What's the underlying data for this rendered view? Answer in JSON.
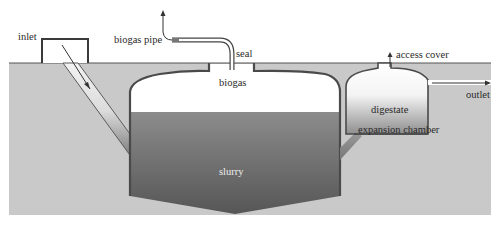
{
  "diagram": {
    "labels": {
      "inlet": "inlet",
      "biogas_pipe": "biogas pipe",
      "seal": "seal",
      "biogas": "biogas",
      "access_cover": "access cover",
      "outlet": "outlet",
      "digestate": "digestate",
      "expansion_chamber": "expansion chamber",
      "slurry": "slurry"
    },
    "components": [
      {
        "id": "inlet",
        "description": "inlet box with sloped inlet pipe and downward flow arrow"
      },
      {
        "id": "biogas-pipe",
        "description": "bent pipe from dome top with upward arrow"
      },
      {
        "id": "seal",
        "description": "seal at dome neck"
      },
      {
        "id": "digester-dome",
        "description": "main domed chamber holding biogas above slurry"
      },
      {
        "id": "slurry",
        "description": "slurry in main chamber, V-shaped bottom"
      },
      {
        "id": "expansion-chamber",
        "description": "side chamber holding digestate"
      },
      {
        "id": "access-cover",
        "description": "cover on expansion chamber with upward arrow"
      },
      {
        "id": "outlet",
        "description": "outlet pipe with rightward arrow"
      }
    ],
    "colors": {
      "ground": "#c9c9c9",
      "wall": "#4a4a4a",
      "slurry_top": "#8a8a8a",
      "slurry_bottom": "#585858",
      "gas_space": "#ffffff",
      "label": "#2a2a2a"
    }
  }
}
